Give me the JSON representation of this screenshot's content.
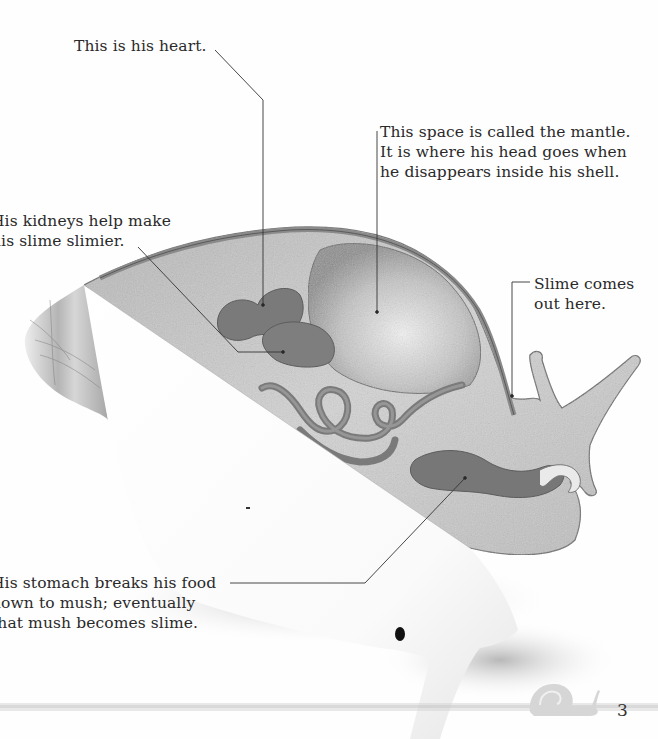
{
  "page": {
    "number": "3"
  },
  "labels": {
    "heart": {
      "lines": [
        "This is his heart."
      ]
    },
    "mantle": {
      "lines": [
        "This space is called the mantle.",
        "It is where his head goes when",
        "he disappears inside his shell."
      ]
    },
    "kidneys": {
      "lines": [
        "His kidneys help make",
        "his slime slimier."
      ]
    },
    "slime": {
      "lines": [
        "Slime comes",
        "out here."
      ]
    },
    "stomach": {
      "lines": [
        "His stomach breaks his food",
        "down to mush; eventually",
        "that mush becomes slime."
      ]
    }
  },
  "illustration": {
    "subject": "snail-cross-section",
    "colors": {
      "body": "#c9c9c9",
      "organ": "#7a7a7a",
      "outline": "#555555",
      "shell_cut": "#ffffff",
      "leader_line": "#333333",
      "footer_strip": "#cfcfcf",
      "footer_snail": "#d8d8d8"
    }
  }
}
